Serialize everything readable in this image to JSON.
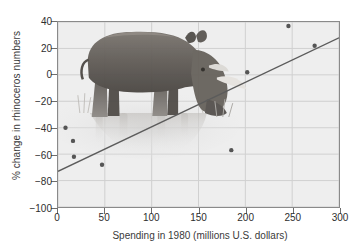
{
  "chart_data": {
    "type": "scatter",
    "title": "",
    "xlabel": "Spending in 1980 (millions U.S. dollars)",
    "ylabel": "% change in rhinoceros numbers",
    "xlim": [
      0,
      300
    ],
    "ylim": [
      -100,
      40
    ],
    "xticks": [
      0,
      50,
      100,
      150,
      200,
      250,
      300
    ],
    "yticks": [
      -100,
      -80,
      -60,
      -40,
      -20,
      0,
      20,
      40
    ],
    "xtick_labels": [
      "0",
      "50",
      "100",
      "150",
      "200",
      "250",
      "300"
    ],
    "ytick_labels": [
      "−100",
      "−80",
      "−60",
      "−40",
      "−20",
      "0",
      "20",
      "40"
    ],
    "grid": true,
    "legend": "none",
    "points": [
      {
        "x": 8,
        "y": -40
      },
      {
        "x": 16,
        "y": -50
      },
      {
        "x": 17,
        "y": -62
      },
      {
        "x": 47,
        "y": -68
      },
      {
        "x": 185,
        "y": -57
      },
      {
        "x": 202,
        "y": 2
      },
      {
        "x": 246,
        "y": 37
      },
      {
        "x": 274,
        "y": 22
      }
    ],
    "trendline": {
      "type": "line",
      "x": [
        0,
        300
      ],
      "y": [
        -73,
        28
      ]
    },
    "annotations": [
      {
        "name": "rhinoceros-illustration",
        "description": "Grayscale drawing of a rhinoceros standing in water with reflection, overlaying the upper-left of the plot area"
      }
    ],
    "colors": {
      "plot_background": "#eeeeee",
      "grid": "#cfcfcf",
      "axis": "#8a8a8a",
      "point": "#555555",
      "trendline": "#5b5b5b",
      "text": "#2e2e2e",
      "page_background": "#ffffff"
    }
  }
}
